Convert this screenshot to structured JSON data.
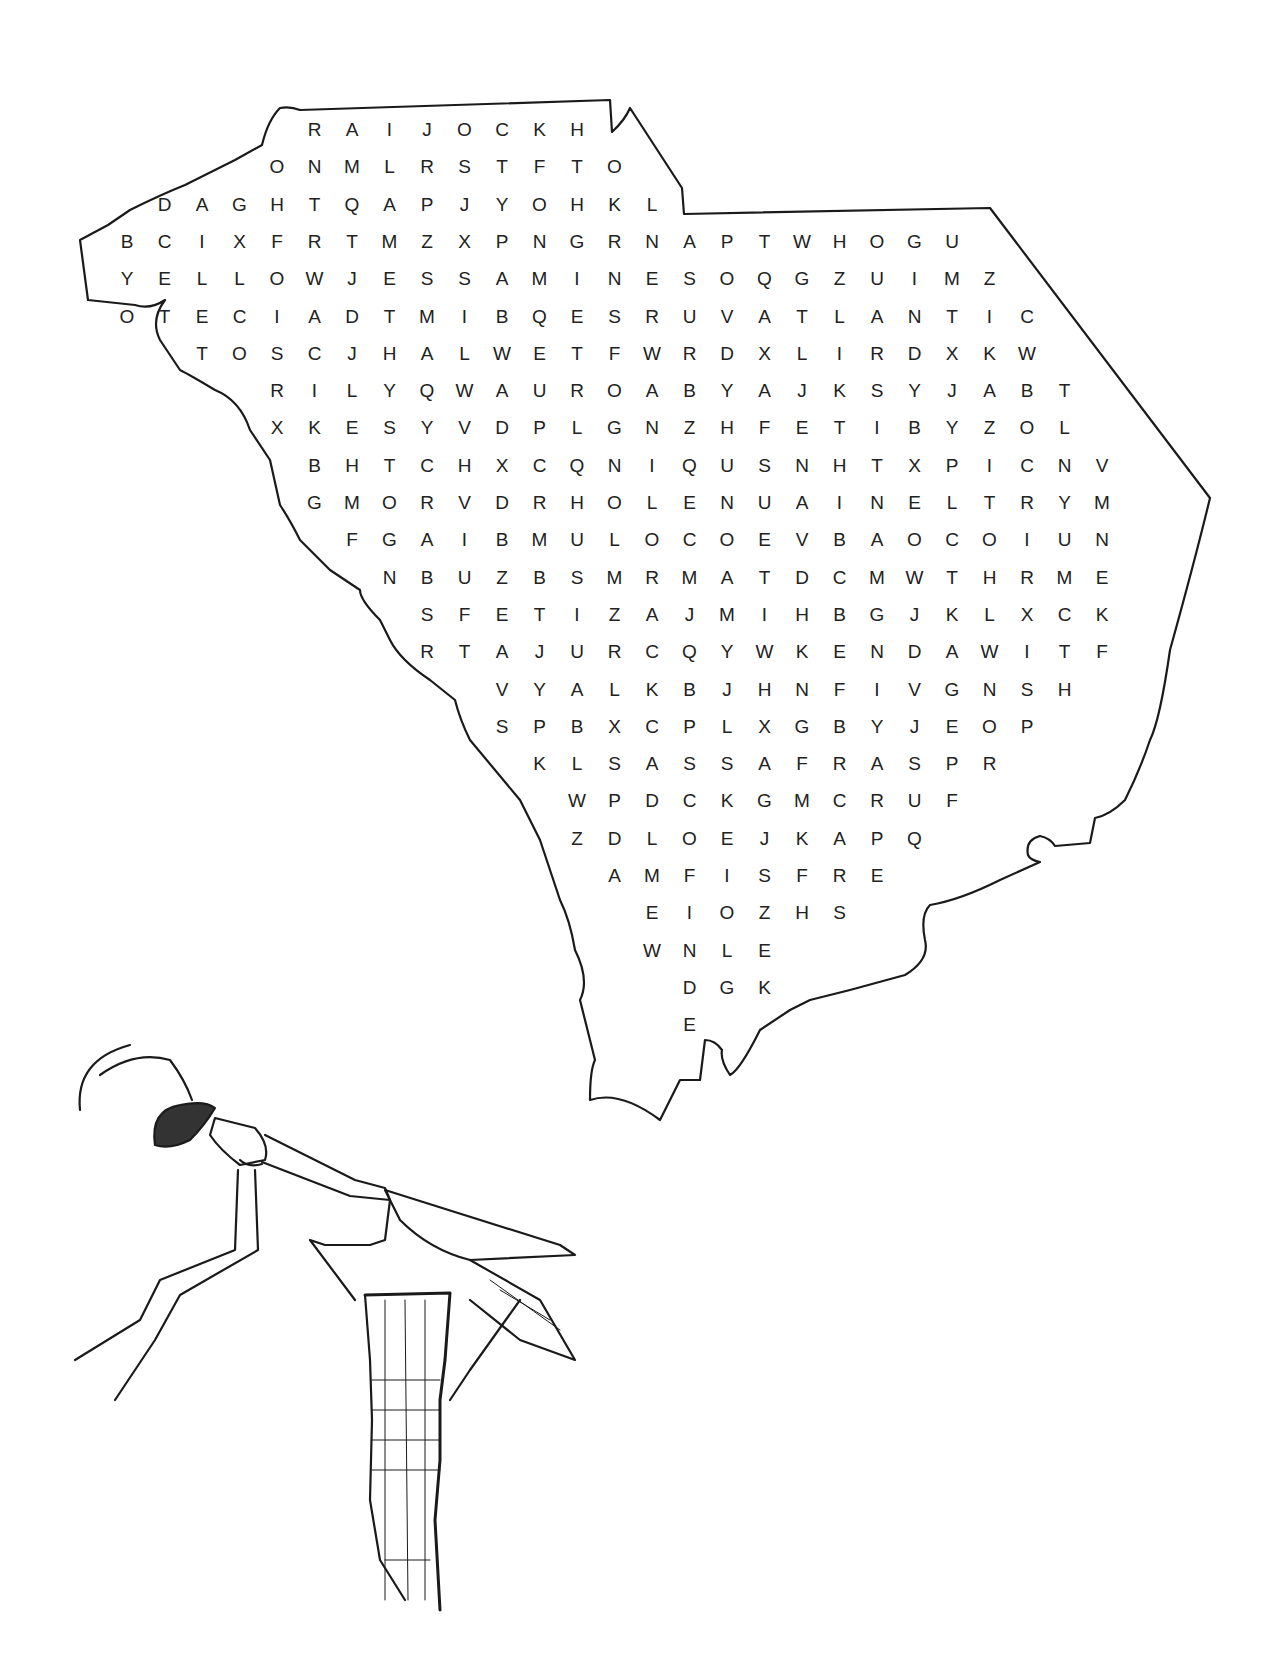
{
  "puzzle": {
    "title": "South Carolina word search",
    "grid_origin": {
      "x": 127,
      "y": 130
    },
    "col_spacing": 37.5,
    "row_spacing": 37.3,
    "rows": [
      {
        "start_col": 5,
        "letters": "RAIJOCKH"
      },
      {
        "start_col": 4,
        "letters": "ONMLRSTFTO"
      },
      {
        "start_col": 1,
        "letters": "DAGHTQAPJYOHKL"
      },
      {
        "start_col": 0,
        "letters": "BCIXFRTMZXPNGRNAPTWHOGU"
      },
      {
        "start_col": 0,
        "letters": "YELLOWJESSAMINESOQGZUIMZ"
      },
      {
        "start_col": 0,
        "letters": "OTECIADTMIBQESRUVATLANTIC"
      },
      {
        "start_col": 2,
        "letters": "TOSCJHALWETFWRDXLIRDXKW"
      },
      {
        "start_col": 4,
        "letters": "RILYQWAUROABYAJKSYJABT"
      },
      {
        "start_col": 4,
        "letters": "XKESYVDPLGNZHFETIBYZOL"
      },
      {
        "start_col": 5,
        "letters": "BHTCHXCQNIQUSNHTXPICNV"
      },
      {
        "start_col": 5,
        "letters": "GMORVDRHOLENUAINELTRYM"
      },
      {
        "start_col": 6,
        "letters": "FGAIBMULOCOEVBAOCOIUN"
      },
      {
        "start_col": 7,
        "letters": "NBUZBSMRMATDCMWTHRME"
      },
      {
        "start_col": 8,
        "letters": "SFETIZAJMIHBGJKLXCK"
      },
      {
        "start_col": 8,
        "letters": "RTAJURCQYWKENDAWITF"
      },
      {
        "start_col": 10,
        "letters": "VYALKBJHNFIVGNSH"
      },
      {
        "start_col": 10,
        "letters": "SPBXCPLXGBYJEOP"
      },
      {
        "start_col": 11,
        "letters": "KLSASSAFRASPR"
      },
      {
        "start_col": 12,
        "letters": "WPDCKGMCRUF"
      },
      {
        "start_col": 12,
        "letters": "ZDLOEJKAPQ"
      },
      {
        "start_col": 13,
        "letters": "AMFISFRE"
      },
      {
        "start_col": 14,
        "letters": "EIOZHS"
      },
      {
        "start_col": 14,
        "letters": "WNLE"
      },
      {
        "start_col": 15,
        "letters": "DGK"
      },
      {
        "start_col": 15,
        "letters": "E"
      }
    ]
  },
  "illustration": {
    "subject": "praying mantis on a stump",
    "icon": "mantis-icon"
  },
  "colors": {
    "ink": "#1a1a1a",
    "background": "#ffffff"
  }
}
